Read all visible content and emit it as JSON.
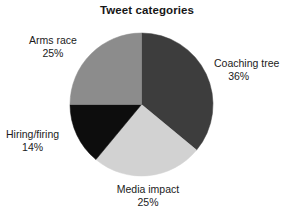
{
  "chart_data": {
    "type": "pie",
    "title": "Tweet categories",
    "xlabel": "",
    "ylabel": "",
    "labels": [
      "Coaching tree",
      "Media impact",
      "Hiring/firing",
      "Arms race"
    ],
    "values": [
      36,
      25,
      14,
      25
    ],
    "value_suffix": "%",
    "colors": [
      "#3d3d3d",
      "#d2d2d2",
      "#0d0d0d",
      "#8c8c8c"
    ],
    "legend": "none",
    "labels_position": "outside",
    "start_angle_deg": 0,
    "direction": "clockwise",
    "slices": [
      {
        "label": "Coaching tree",
        "percent": "36%",
        "value": 36,
        "color": "#3d3d3d",
        "start_deg": 0,
        "end_deg": 129.6
      },
      {
        "label": "Media impact",
        "percent": "25%",
        "value": 25,
        "color": "#d2d2d2",
        "start_deg": 129.6,
        "end_deg": 219.6
      },
      {
        "label": "Hiring/firing",
        "percent": "14%",
        "value": 14,
        "color": "#0d0d0d",
        "start_deg": 219.6,
        "end_deg": 270.0
      },
      {
        "label": "Arms race",
        "percent": "25%",
        "value": 25,
        "color": "#8c8c8c",
        "start_deg": 270.0,
        "end_deg": 360.0
      }
    ]
  },
  "chart": {
    "title": "Tweet categories",
    "coaching_tree": {
      "name": "Coaching tree",
      "percent": "36%"
    },
    "media_impact": {
      "name": "Media impact",
      "percent": "25%"
    },
    "hiring_firing": {
      "name": "Hiring/firing",
      "percent": "14%"
    },
    "arms_race": {
      "name": "Arms race",
      "percent": "25%"
    }
  }
}
